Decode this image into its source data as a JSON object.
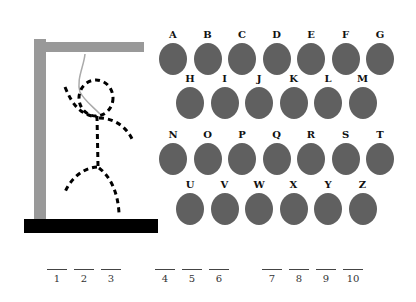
{
  "game": {
    "title": "Hangman"
  },
  "keyboard": {
    "rows": [
      {
        "y": 28,
        "x0": 158,
        "keys": [
          "A",
          "B",
          "C",
          "D",
          "E",
          "F",
          "G"
        ]
      },
      {
        "y": 72,
        "x0": 175,
        "keys": [
          "H",
          "I",
          "J",
          "K",
          "L",
          "M"
        ]
      },
      {
        "y": 128,
        "x0": 158,
        "keys": [
          "N",
          "O",
          "P",
          "Q",
          "R",
          "S",
          "T"
        ]
      },
      {
        "y": 178,
        "x0": 175,
        "keys": [
          "U",
          "V",
          "W",
          "X",
          "Y",
          "Z"
        ]
      }
    ],
    "spacing": 34.5,
    "button_color": "#606060"
  },
  "answer_slots": {
    "groups": [
      {
        "x0": 47,
        "numbers": [
          "1",
          "2",
          "3"
        ]
      },
      {
        "x0": 155,
        "numbers": [
          "4",
          "5",
          "6"
        ]
      },
      {
        "x0": 262,
        "numbers": [
          "7",
          "8",
          "9",
          "10"
        ]
      }
    ],
    "spacing": 27
  },
  "gallows": {
    "post_color": "#999999",
    "base_color": "#000000",
    "rope_color": "#aaaaaa"
  }
}
